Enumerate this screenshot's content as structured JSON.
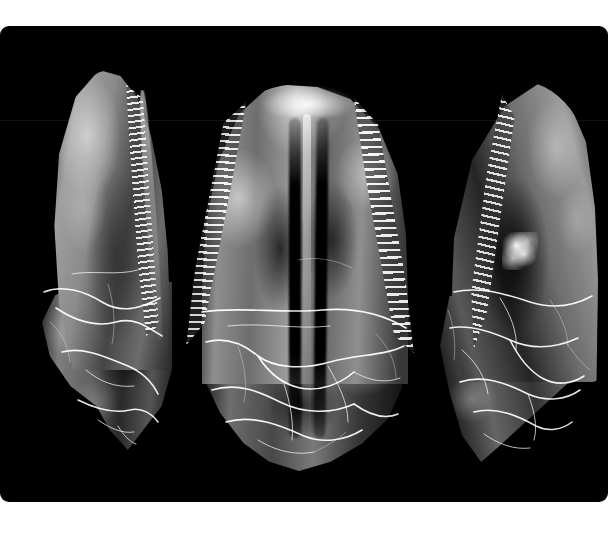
{
  "image": {
    "kind": "photograph",
    "subject": "fossil theropod dinosaur tooth, three views",
    "background_color": "#000000",
    "border_color": "#ffffff",
    "plate": {
      "x": 0,
      "y": 26,
      "width": 608,
      "height": 476,
      "corner_radius_px": 9
    },
    "canvas": {
      "width": 608,
      "height": 546
    }
  },
  "specimens": [
    {
      "id": "tooth-left",
      "label": "left view",
      "orientation": "lingual / side view, apex up",
      "serration_edge": "right",
      "description": "narrow recurved crown with a fine row of denticles along the right carina; broken root base with bright repair cracks"
    },
    {
      "id": "tooth-middle",
      "label": "middle view",
      "orientation": "labial / broad face view, apex up",
      "serration_edge": "both",
      "description": "broad face showing denticle rows on both carinae, two dark longitudinal grooves flanking a bright central ridge, and a network of bright repair cracks across the lower half"
    },
    {
      "id": "tooth-right",
      "label": "right view",
      "orientation": "opposite side view, apex up",
      "serration_edge": "left",
      "description": "mirror-image side view with denticles along the left carina, a bright mineral/adhesive speck mid-crown, and fractured root with bright repair cracks"
    }
  ],
  "features": {
    "denticle_rows": 3,
    "crack_network": "bright white filled fracture lines",
    "scan_artifact": "faint horizontal line across upper third of plate"
  },
  "colors": {
    "background": "#000000",
    "border": "#ffffff",
    "enamel_highlight": "#f0f0f0",
    "enamel_midtone": "#8a8a8a",
    "shadow": "#1a1a1a",
    "crack_fill": "#ffffff"
  }
}
